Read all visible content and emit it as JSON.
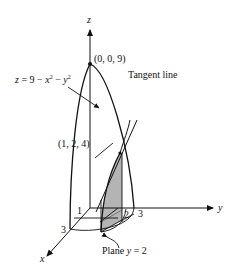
{
  "figure": {
    "axes": {
      "z_label": "z",
      "y_label": "y",
      "x_label": "x"
    },
    "surface_label": "z = 9 − x² − y²",
    "surface_label_parts": {
      "z": "z",
      "eq": " = 9 − ",
      "x": "x",
      "sup2a": "2",
      "minus": " − ",
      "y": "y",
      "sup2b": "2"
    },
    "peak_label": "(0, 0, 9)",
    "point_label": "(1, 2, 4)",
    "tangent_label": "Tangent line",
    "plane_label": "Plane y = 2",
    "plane_label_parts": {
      "plane": "Plane ",
      "y": "y",
      "eq": " = 2"
    },
    "tick_labels": {
      "x1": "1",
      "x3": "3",
      "y2": "2",
      "y3": "3"
    },
    "colors": {
      "line": "#111111",
      "shade": "#b4b4b4",
      "background": "#ffffff"
    }
  }
}
